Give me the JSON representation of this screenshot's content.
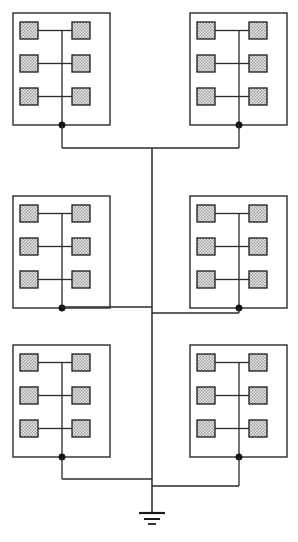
{
  "diagram": {
    "type": "electrical-schematic",
    "canvas": {
      "width": 298,
      "height": 542
    },
    "colors": {
      "background": "#ffffff",
      "wire": "#2b2b2b",
      "cell_border": "#1a1a1a",
      "cell_fill_light": "#e8e8e8",
      "cell_fill_stipple": "#9a9a9a",
      "junction": "#111111"
    },
    "trunk": {
      "label": "central-bus",
      "x": 152,
      "top_y": 148,
      "bottom_y": 513
    },
    "ground": {
      "label": "earth-ground",
      "symbol": "ground-3-bar",
      "x": 152,
      "y": 513,
      "bars": [
        {
          "half_width": 13,
          "y": 513,
          "thickness": 2.2
        },
        {
          "half_width": 8,
          "y": 519,
          "thickness": 2.0
        },
        {
          "half_width": 4,
          "y": 524,
          "thickness": 1.8
        }
      ]
    },
    "module_template": {
      "label": "cell-module",
      "width": 97,
      "height": 112,
      "internal_bus_offset_x": 49,
      "cell": {
        "width": 18,
        "height": 17
      },
      "left_cell_offset_x": 7,
      "right_cell_offset_x": 59,
      "cell_row_offsets_y": [
        9,
        42,
        75
      ],
      "cell_count": 6
    },
    "modules": [
      {
        "id": "module-top-left",
        "row": 1,
        "column": "left",
        "x": 13,
        "y": 13,
        "junction_x": 62,
        "junction_y": 125,
        "tie_y": 148,
        "tie_direction": "right"
      },
      {
        "id": "module-top-right",
        "row": 1,
        "column": "right",
        "x": 190,
        "y": 13,
        "junction_x": 239,
        "junction_y": 125,
        "tie_y": 148,
        "tie_direction": "left"
      },
      {
        "id": "module-middle-left",
        "row": 2,
        "column": "left",
        "x": 13,
        "y": 196,
        "junction_x": 62,
        "junction_y": 308,
        "tie_y": 307,
        "tie_direction": "right"
      },
      {
        "id": "module-middle-right",
        "row": 2,
        "column": "right",
        "x": 190,
        "y": 196,
        "junction_x": 239,
        "junction_y": 308,
        "tie_y": 313,
        "tie_direction": "left"
      },
      {
        "id": "module-bottom-left",
        "row": 3,
        "column": "left",
        "x": 13,
        "y": 345,
        "junction_x": 62,
        "junction_y": 457,
        "tie_y": 479,
        "tie_direction": "right"
      },
      {
        "id": "module-bottom-right",
        "row": 3,
        "column": "right",
        "x": 190,
        "y": 345,
        "junction_x": 239,
        "junction_y": 457,
        "tie_y": 486,
        "tie_direction": "left"
      }
    ]
  }
}
